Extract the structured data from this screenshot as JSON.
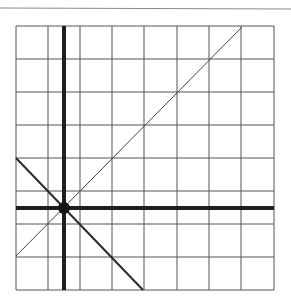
{
  "diagram": {
    "type": "coordinate-grid",
    "top_rule": {
      "x1": 0,
      "y1": 8,
      "x2": 291,
      "y2": 9,
      "color": "#8a8a8a"
    },
    "grid": {
      "left": 16,
      "top": 26,
      "right": 274,
      "bottom": 290,
      "columns_x": [
        16,
        48,
        80,
        112,
        144,
        177,
        209,
        241,
        274
      ],
      "rows_y": [
        26,
        59,
        92,
        125,
        158,
        191,
        224,
        257,
        290
      ],
      "color": "#555555"
    },
    "axes": {
      "vertical_x": 64,
      "horizontal_y": 208,
      "color": "#1e1e1e",
      "width": 4
    },
    "origin": {
      "x": 64,
      "y": 208,
      "r": 6,
      "color": "#151515"
    },
    "lines": [
      {
        "name": "ascending-diagonal",
        "x1": 16,
        "y1": 256,
        "x2": 242,
        "y2": 27,
        "width": 1,
        "color": "#444444"
      },
      {
        "name": "descending-diagonal",
        "x1": 16,
        "y1": 158,
        "x2": 143,
        "y2": 290,
        "width": 2,
        "color": "#2a2a2a"
      }
    ]
  }
}
